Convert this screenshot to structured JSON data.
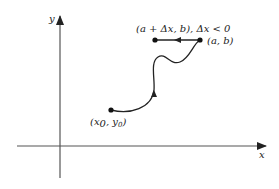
{
  "diagram": {
    "axes": {
      "x_label": "x",
      "y_label": "y"
    },
    "points": {
      "start": {
        "label_main": "(x",
        "sub0": "0",
        "sep": ", y",
        "sub1": "0",
        "close": ")"
      },
      "end": {
        "label": "(a, b)"
      },
      "shifted": {
        "label": "(a + Δx, b), Δx < 0"
      }
    },
    "colors": {
      "axis": "#555555",
      "curve": "#222222",
      "background": "#ffffff"
    }
  }
}
